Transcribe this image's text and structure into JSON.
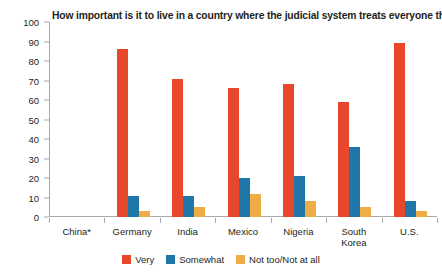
{
  "chart_data": {
    "type": "bar",
    "title": "How important is it to live in a country where the judicial system treats everyone the same?",
    "xlabel": "",
    "ylabel": "",
    "ylim": [
      0,
      100
    ],
    "yticks": [
      0,
      10,
      20,
      30,
      40,
      50,
      60,
      70,
      80,
      90,
      100
    ],
    "grid": false,
    "legend_position": "bottom-center",
    "categories": [
      "China*",
      "Germany",
      "India",
      "Mexico",
      "Nigeria",
      "South\nKorea",
      "U.S."
    ],
    "series": [
      {
        "name": "Very",
        "color": "#e8472b",
        "values": [
          null,
          86,
          71,
          66,
          68,
          59,
          89
        ]
      },
      {
        "name": "Somewhat",
        "color": "#1f76a8",
        "values": [
          null,
          11,
          11,
          20,
          21,
          36,
          8
        ]
      },
      {
        "name": "Not too/Not at all",
        "color": "#efae45",
        "values": [
          null,
          3,
          5,
          12,
          8,
          5,
          3
        ]
      }
    ]
  },
  "axis": {
    "line_color": "#a7a9ac"
  }
}
